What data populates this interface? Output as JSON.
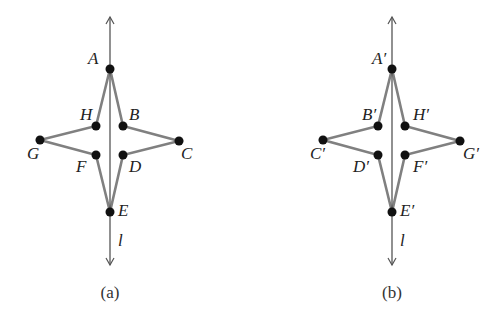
{
  "figure": {
    "panels": [
      {
        "caption": "(a)",
        "axis_label": "l",
        "axis": {
          "x": 110,
          "y_top": 17,
          "y_bottom": 265
        },
        "points": [
          {
            "name": "A",
            "x": 110,
            "y": 69,
            "lx": 88,
            "ly": 64
          },
          {
            "name": "B",
            "x": 123,
            "y": 126,
            "lx": 129,
            "ly": 120
          },
          {
            "name": "C",
            "x": 179,
            "y": 141,
            "lx": 181,
            "ly": 159
          },
          {
            "name": "D",
            "x": 123,
            "y": 155,
            "lx": 129,
            "ly": 172
          },
          {
            "name": "E",
            "x": 110,
            "y": 212,
            "lx": 118,
            "ly": 216
          },
          {
            "name": "F",
            "x": 96,
            "y": 155,
            "lx": 76,
            "ly": 172
          },
          {
            "name": "G",
            "x": 40,
            "y": 140,
            "lx": 27,
            "ly": 159
          },
          {
            "name": "H",
            "x": 96,
            "y": 126,
            "lx": 80,
            "ly": 120
          }
        ],
        "polygon_order": [
          "A",
          "B",
          "C",
          "D",
          "E",
          "F",
          "G",
          "H"
        ]
      },
      {
        "caption": "(b)",
        "axis_label": "l",
        "axis": {
          "x": 392,
          "y_top": 17,
          "y_bottom": 265
        },
        "points": [
          {
            "name": "A′",
            "x": 392,
            "y": 69,
            "lx": 372,
            "ly": 64
          },
          {
            "name": "B′",
            "x": 378,
            "y": 126,
            "lx": 362,
            "ly": 120
          },
          {
            "name": "C′",
            "x": 323,
            "y": 140,
            "lx": 310,
            "ly": 159
          },
          {
            "name": "D′",
            "x": 378,
            "y": 155,
            "lx": 353,
            "ly": 172
          },
          {
            "name": "E′",
            "x": 392,
            "y": 212,
            "lx": 400,
            "ly": 216
          },
          {
            "name": "F′",
            "x": 405,
            "y": 155,
            "lx": 413,
            "ly": 172
          },
          {
            "name": "G′",
            "x": 460,
            "y": 141,
            "lx": 463,
            "ly": 159
          },
          {
            "name": "H′",
            "x": 405,
            "y": 126,
            "lx": 413,
            "ly": 120
          }
        ],
        "polygon_order": [
          "A′",
          "H′",
          "G′",
          "F′",
          "E′",
          "D′",
          "C′",
          "B′"
        ]
      }
    ],
    "colors": {
      "edge": "#808080",
      "axis": "#555555",
      "point": "#111111"
    }
  }
}
